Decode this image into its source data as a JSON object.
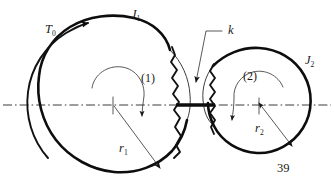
{
  "figure": {
    "caption_number": "39",
    "colors": {
      "ink": "#0d0d0d",
      "centerline": "#3a3a3a",
      "background": "#ffffff"
    }
  },
  "labels": {
    "applied_torque": {
      "symbol": "T",
      "subscript": "0",
      "full": "T0"
    },
    "inertia_left": {
      "symbol": "J",
      "subscript": "1",
      "full": "J1"
    },
    "inertia_right": {
      "symbol": "J",
      "subscript": "2",
      "full": "J2"
    },
    "spring_constant": {
      "symbol": "k",
      "full": "k"
    },
    "radius_left": {
      "symbol": "r",
      "subscript": "1",
      "full": "r1"
    },
    "radius_right": {
      "symbol": "r",
      "subscript": "2",
      "full": "r2"
    },
    "disc_one": "(1)",
    "disc_two": "(2)",
    "figure_number": "39"
  },
  "elements": {
    "left_disc": {
      "name": "disc-1",
      "inertia_label": "J1",
      "radius_label": "r1",
      "rotation": "clockwise"
    },
    "right_disc": {
      "name": "disc-2",
      "inertia_label": "J2",
      "radius_label": "r2",
      "rotation": "counter-clockwise"
    },
    "coupling": {
      "name": "torsional-spring",
      "stiffness_label": "k"
    },
    "axis": {
      "name": "center-axis",
      "style": "dash-dot"
    },
    "torque_arrow": {
      "name": "applied-torque-arrow",
      "label": "T0",
      "direction": "clockwise"
    }
  }
}
